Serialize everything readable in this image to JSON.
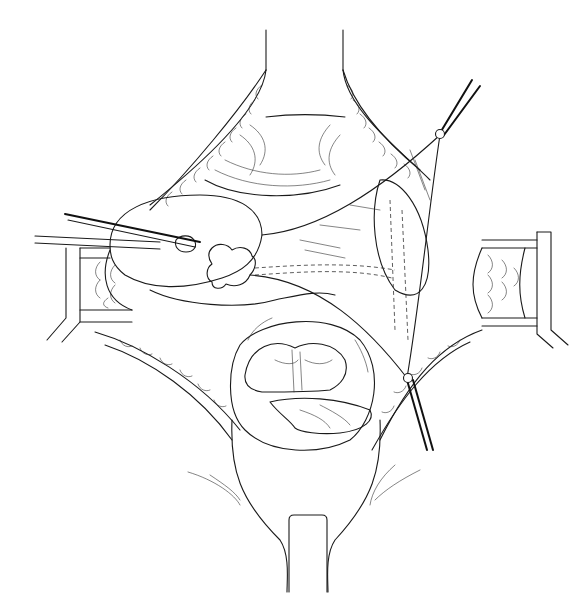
{
  "figure": {
    "type": "surgical line illustration",
    "style": "black ink line drawing on white",
    "colors": {
      "background": "#ffffff",
      "ink": "#1a1a1a"
    },
    "structures": [
      {
        "id": "upper-retractor",
        "label": ""
      },
      {
        "id": "lower-retractor",
        "label": ""
      },
      {
        "id": "left-retractor",
        "label": ""
      },
      {
        "id": "right-retractor",
        "label": ""
      },
      {
        "id": "uterus-fundus",
        "label": ""
      },
      {
        "id": "adnexal-mass",
        "label": ""
      },
      {
        "id": "broad-ligament-leaf",
        "label": ""
      },
      {
        "id": "bowel-loops",
        "label": ""
      },
      {
        "id": "forceps-left",
        "label": ""
      },
      {
        "id": "suture-clamp-upper",
        "label": ""
      },
      {
        "id": "suture-clamp-lower",
        "label": ""
      }
    ]
  }
}
